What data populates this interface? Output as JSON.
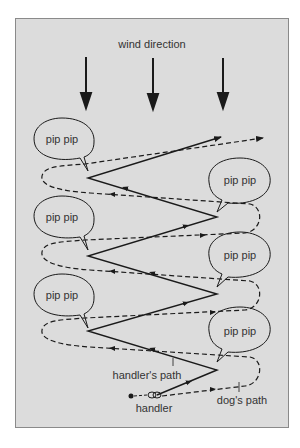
{
  "diagram": {
    "title": "wind direction",
    "bubble_text": "pip pip",
    "labels": {
      "handler_path": "handler's path",
      "dog_path": "dog's path",
      "handler": "handler"
    },
    "colors": {
      "background": "#dcdcdc",
      "frame": "#8a8a8a",
      "ink": "#1a1a1a"
    },
    "bubbles": [
      {
        "side": "left",
        "text": "pip pip"
      },
      {
        "side": "right",
        "text": "pip pip"
      },
      {
        "side": "left",
        "text": "pip pip"
      },
      {
        "side": "right",
        "text": "pip pip"
      },
      {
        "side": "left",
        "text": "pip pip"
      },
      {
        "side": "right",
        "text": "pip pip"
      }
    ],
    "wind_arrows": 3
  }
}
